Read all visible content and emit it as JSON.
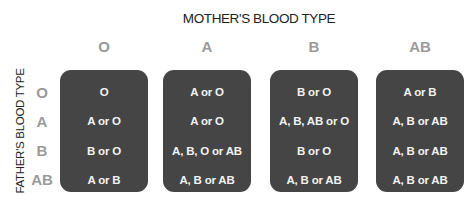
{
  "title": "MOTHER'S BLOOD TYPE",
  "side_label": "FATHER'S BLOOD TYPE",
  "columns": [
    "O",
    "A",
    "B",
    "AB"
  ],
  "rows": [
    "O",
    "A",
    "B",
    "AB"
  ],
  "grid": [
    [
      "O",
      "A or O",
      "B or O",
      "A or B"
    ],
    [
      "A or O",
      "A or O",
      "A, B, AB or O",
      "A, B or AB"
    ],
    [
      "B or O",
      "A, B, O or AB",
      "B or O",
      "A, B or AB"
    ],
    [
      "A or B",
      "A, B or AB",
      "A, B or AB",
      "A, B or AB"
    ]
  ],
  "colors": {
    "box_fill": "#454545",
    "box_text": "#f2f2f2",
    "axis_label": "#9a9a9a",
    "title_text": "#222222"
  }
}
